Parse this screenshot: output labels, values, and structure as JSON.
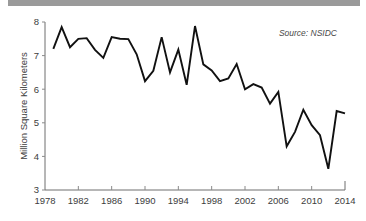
{
  "top_bar": {
    "color": "#9a9a9a"
  },
  "chart_data": {
    "type": "line",
    "title": "",
    "subtitle": "",
    "xlabel": "",
    "ylabel": "Million Square Kilometers",
    "annotation": "Source: NSIDC",
    "grid": false,
    "legend": "none",
    "line_color": "#111111",
    "axis_color": "#6e6e6e",
    "xlim": [
      1978,
      2014
    ],
    "ylim": [
      3,
      8
    ],
    "x_ticks": [
      1978,
      1982,
      1986,
      1990,
      1994,
      1998,
      2002,
      2006,
      2010,
      2014
    ],
    "x_tick_labels": [
      "1978",
      "1982",
      "1986",
      "1990",
      "1994",
      "1998",
      "2002",
      "2006",
      "2010",
      "2014"
    ],
    "y_ticks": [
      3,
      4,
      5,
      6,
      7,
      8
    ],
    "y_tick_labels": [
      "3",
      "4",
      "5",
      "6",
      "7",
      "8"
    ],
    "x": [
      1979,
      1980,
      1981,
      1982,
      1983,
      1984,
      1985,
      1986,
      1987,
      1988,
      1989,
      1990,
      1991,
      1992,
      1993,
      1994,
      1995,
      1996,
      1997,
      1998,
      1999,
      2000,
      2001,
      2002,
      2003,
      2004,
      2005,
      2006,
      2007,
      2008,
      2009,
      2010,
      2011,
      2012,
      2013,
      2014
    ],
    "values": [
      7.2,
      7.85,
      7.25,
      7.5,
      7.52,
      7.17,
      6.93,
      7.55,
      7.5,
      7.49,
      7.04,
      6.24,
      6.55,
      7.55,
      6.5,
      7.18,
      6.13,
      7.88,
      6.74,
      6.56,
      6.24,
      6.32,
      6.75,
      6.0,
      6.15,
      6.05,
      5.57,
      5.92,
      4.3,
      4.73,
      5.39,
      4.93,
      4.63,
      3.63,
      5.35,
      5.28
    ]
  }
}
